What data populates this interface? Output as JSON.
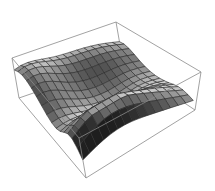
{
  "chart_data": {
    "type": "surface3d",
    "title": "",
    "xlabel": "",
    "ylabel": "",
    "zlabel": "",
    "axes_ticks": "none",
    "boxed": true,
    "mesh": {
      "nx": 15,
      "ny": 15
    },
    "x_range": [
      0,
      1
    ],
    "y_range": [
      0,
      1
    ],
    "z_range": [
      0,
      1
    ],
    "components": [
      {
        "kind": "gaussian",
        "cx": 0.85,
        "cy": 0.35,
        "sx": 0.14,
        "sy": 0.35,
        "amp": 0.95
      },
      {
        "kind": "gaussian",
        "cx": 0.25,
        "cy": 0.05,
        "sx": 0.25,
        "sy": 0.2,
        "amp": 0.55
      },
      {
        "kind": "gaussian",
        "cx": 0.05,
        "cy": 0.6,
        "sx": 0.18,
        "sy": 0.5,
        "amp": 0.55
      },
      {
        "kind": "gaussian",
        "cx": 0.6,
        "cy": 0.85,
        "sx": 0.25,
        "sy": 0.15,
        "amp": 0.15
      }
    ],
    "base_level": 0.12,
    "colors": {
      "surface_light": "#e6e6e6",
      "surface_dark": "#1e1e1e",
      "mesh": "#2a2a2a",
      "box": "#8a8a8a",
      "background": "#ffffff"
    }
  },
  "projection": {
    "box_corners_px": {
      "top_left": [
        12,
        58
      ],
      "top_back": [
        116,
        22
      ],
      "top_right": [
        201,
        72
      ],
      "bottom_left": [
        19,
        98
      ],
      "bottom_front": [
        86,
        178
      ],
      "bottom_right": [
        195,
        110
      ]
    }
  }
}
